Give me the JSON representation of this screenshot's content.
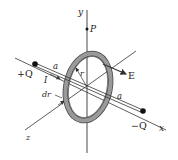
{
  "diagram": {
    "type": "physics-figure",
    "colors": {
      "line": "#333333",
      "ring_fill": "#8a8a8a",
      "ring_edge": "#444444",
      "background": "#ffffff"
    },
    "labels": {
      "y_axis": "y",
      "x_axis": "x",
      "z_axis": "z",
      "point_p": "P",
      "plus_charge": "+Q",
      "minus_charge": "−Q",
      "half_sep_left": "a",
      "half_sep_right": "a",
      "current": "I",
      "ring_width": "dr",
      "ring_radius": "r",
      "field": "E"
    }
  }
}
